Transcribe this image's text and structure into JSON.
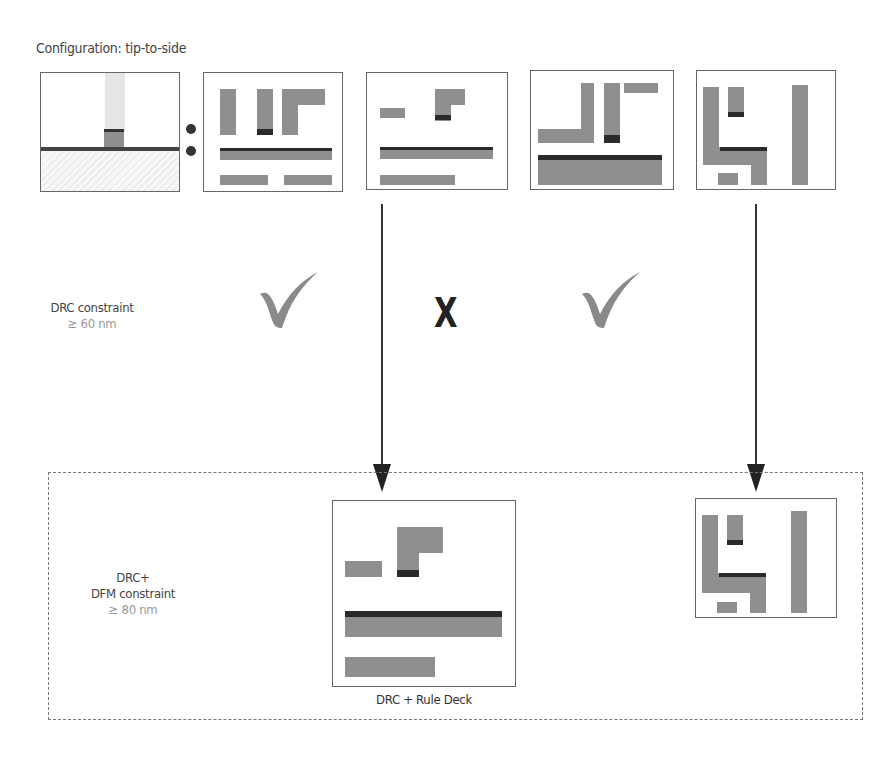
{
  "diagram": {
    "title": "Configuration: tip-to-side",
    "drc_row": {
      "label": "DRC constraint",
      "value": "≥ 60 nm",
      "results": [
        {
          "panel": 1,
          "status": "pass",
          "symbol": "✓"
        },
        {
          "panel": 2,
          "status": "fail",
          "symbol": "X"
        },
        {
          "panel": 3,
          "status": "pass",
          "symbol": "✓"
        },
        {
          "panel": 4,
          "status": "fail",
          "symbol": ""
        }
      ]
    },
    "dfm_row": {
      "label_line1": "DRC+",
      "label_line2": "DFM constraint",
      "value": "≥ 80 nm",
      "caption": "DRC + Rule Deck"
    },
    "colors": {
      "shape_fill": "#8f8f8f",
      "tip_dark": "#2a2a2a",
      "border": "#666666",
      "check": "#8a8a8a"
    }
  }
}
